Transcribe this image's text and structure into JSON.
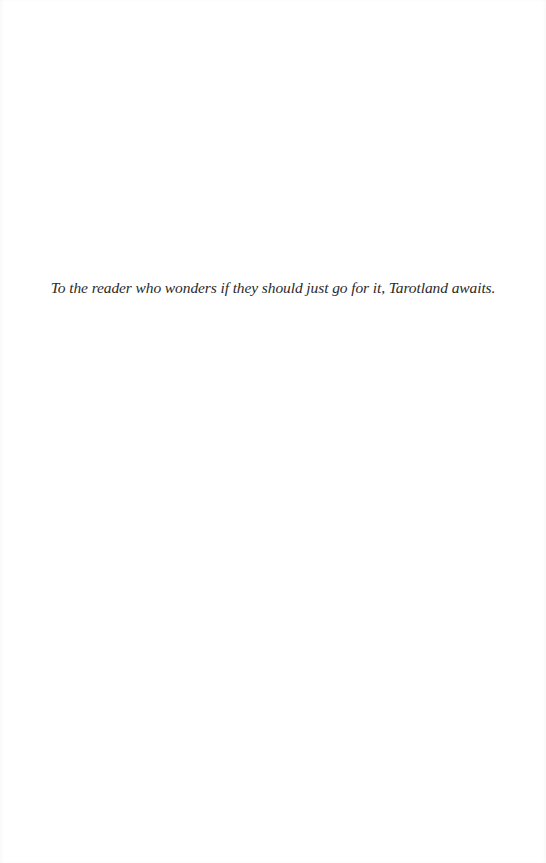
{
  "page": {
    "dedication": "To the reader who wonders if they should just go for it, Tarotland awaits."
  }
}
